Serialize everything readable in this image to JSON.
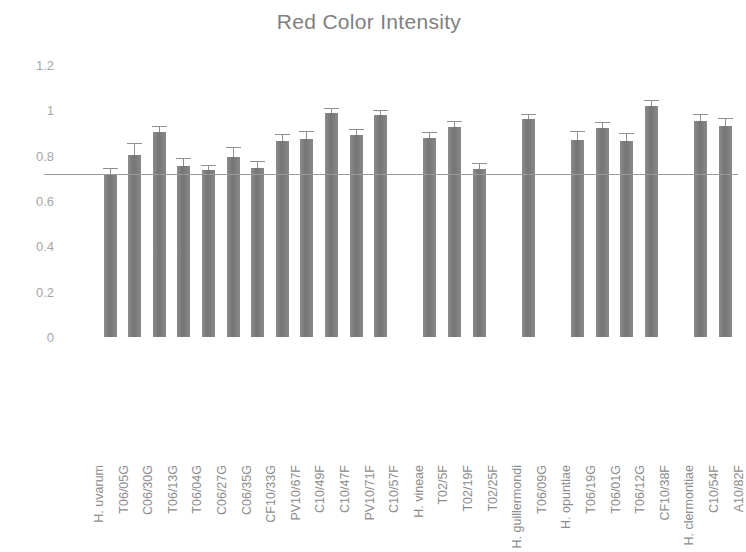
{
  "chart_data": {
    "type": "bar",
    "title": "Red Color Intensity",
    "xlabel": "",
    "ylabel": "",
    "ylim": [
      0,
      1.2
    ],
    "ytick_labels": [
      "0",
      "0.2",
      "0.4",
      "0.6",
      "0.8",
      "1",
      "1.2"
    ],
    "ytick_values": [
      0,
      0.2,
      0.4,
      0.6,
      0.8,
      1,
      1.2
    ],
    "grid": false,
    "legend": "none",
    "bar_color": "#7c7c7c",
    "error_bar_color": "#8f8f8f",
    "reference_line": {
      "value": 0.72,
      "color": "#9a9a9a",
      "label": ""
    },
    "categories": [
      "H. uvarum",
      "T06/05G",
      "C06/30G",
      "T06/13G",
      "T06/04G",
      "C06/27G",
      "C06/35G",
      "CF10/33G",
      "PV10/67F",
      "C10/49F",
      "C10/47F",
      "PV10/71F",
      "C10/57F",
      "H. vineae",
      "T02/5F",
      "T02/19F",
      "T02/25F",
      "H. guillermondi",
      "T06/09G",
      "H. opuntiae",
      "T06/19G",
      "T06/01G",
      "T06/12G",
      "CF10/38F",
      "H. clermontiae",
      "C10/54F",
      "A10/82F"
    ],
    "group_headers": [
      "H. uvarum",
      "H. vineae",
      "H. guillermondi",
      "H. opuntiae",
      "H. clermontiae"
    ],
    "values": [
      null,
      0.715,
      0.805,
      0.905,
      0.755,
      0.735,
      0.795,
      0.745,
      0.865,
      0.875,
      0.99,
      0.89,
      0.98,
      null,
      0.88,
      0.925,
      0.74,
      null,
      0.96,
      null,
      0.87,
      0.92,
      0.865,
      1.02,
      null,
      0.955,
      0.93
    ],
    "errors": [
      null,
      0.025,
      0.045,
      0.02,
      0.03,
      0.02,
      0.04,
      0.025,
      0.025,
      0.03,
      0.015,
      0.025,
      0.015,
      null,
      0.02,
      0.025,
      0.025,
      null,
      0.02,
      null,
      0.035,
      0.025,
      0.03,
      0.02,
      null,
      0.025,
      0.03
    ]
  }
}
